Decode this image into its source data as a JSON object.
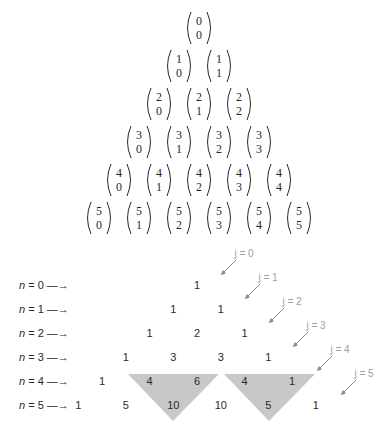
{
  "figure": {
    "binomial_rows": [
      {
        "n": "0",
        "k": [
          "0"
        ]
      },
      {
        "n": "1",
        "k": [
          "0",
          "1"
        ]
      },
      {
        "n": "2",
        "k": [
          "0",
          "1",
          "2"
        ]
      },
      {
        "n": "3",
        "k": [
          "0",
          "1",
          "2",
          "3"
        ]
      },
      {
        "n": "4",
        "k": [
          "0",
          "1",
          "2",
          "3",
          "4"
        ]
      },
      {
        "n": "5",
        "k": [
          "0",
          "1",
          "2",
          "3",
          "4",
          "5"
        ]
      }
    ],
    "row_labels": [
      {
        "var": "n",
        "text": " = 0 —→"
      },
      {
        "var": "n",
        "text": " = 1 —→"
      },
      {
        "var": "n",
        "text": " = 2 —→"
      },
      {
        "var": "n",
        "text": " = 3 —→"
      },
      {
        "var": "n",
        "text": " = 4 —→"
      },
      {
        "var": "n",
        "text": " = 5 —→"
      }
    ],
    "value_rows": [
      [
        "1"
      ],
      [
        "1",
        "1"
      ],
      [
        "1",
        "2",
        "1"
      ],
      [
        "1",
        "3",
        "3",
        "1"
      ],
      [
        "1",
        "4",
        "6",
        "4",
        "1"
      ],
      [
        "1",
        "5",
        "10",
        "10",
        "5",
        "1"
      ]
    ],
    "diagonal_labels": [
      "j = 0",
      "j = 1",
      "j = 2",
      "j = 3",
      "j = 4",
      "j = 5"
    ],
    "shaded_triangles": [
      {
        "top": [
          "4",
          "6"
        ],
        "bottom": "10"
      },
      {
        "top": [
          "4",
          "1"
        ],
        "bottom": "5"
      }
    ],
    "colors": {
      "text": "#2a2a2a",
      "label_gray": "#a0a0a0",
      "shade": "#c8c8c8",
      "arrow": "#8a8a8a"
    }
  }
}
